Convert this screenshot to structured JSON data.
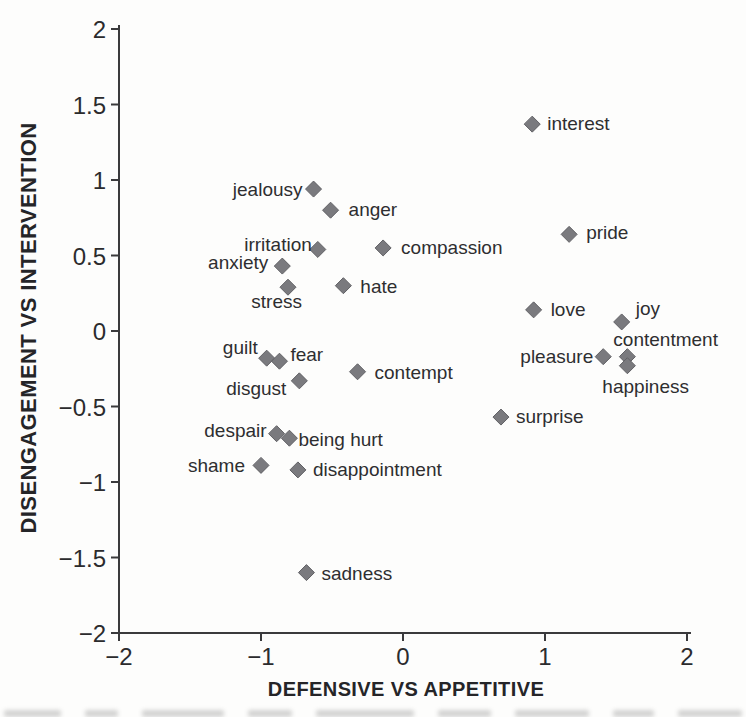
{
  "figure": {
    "background_color": "#fdfdfc",
    "marker_shape": "diamond",
    "marker_color": "#7a7a7e",
    "marker_edge_color": "#616165",
    "axis_color": "#3a3a3c",
    "text_color": "#2e2e30"
  },
  "chart_data": {
    "type": "scatter",
    "title": "",
    "xlabel": "DEFENSIVE VS APPETITIVE",
    "ylabel": "DISENGAGEMENT VS INTERVENTION",
    "xlim": [
      -2,
      2
    ],
    "ylim": [
      -2,
      2
    ],
    "xticks": [
      -2,
      -1,
      0,
      1,
      2
    ],
    "yticks": [
      2,
      1.5,
      1,
      0.5,
      0,
      -0.5,
      -1,
      -1.5,
      -2
    ],
    "grid": false,
    "legend": false,
    "points": [
      {
        "label": "interest",
        "x": 0.91,
        "y": 1.37,
        "anchor": "start",
        "lx": 15,
        "ly": 6
      },
      {
        "label": "jealousy",
        "x": -0.63,
        "y": 0.94,
        "anchor": "end",
        "lx": -11,
        "ly": 7
      },
      {
        "label": "anger",
        "x": -0.51,
        "y": 0.8,
        "anchor": "start",
        "lx": 18,
        "ly": 6
      },
      {
        "label": "irritation",
        "x": -0.6,
        "y": 0.54,
        "anchor": "end",
        "lx": -6,
        "ly": 2
      },
      {
        "label": "anxiety",
        "x": -0.85,
        "y": 0.43,
        "anchor": "end",
        "lx": -14,
        "ly": 3
      },
      {
        "label": "stress",
        "x": -0.81,
        "y": 0.29,
        "anchor": "end",
        "lx": 14,
        "ly": 21
      },
      {
        "label": "hate",
        "x": -0.42,
        "y": 0.3,
        "anchor": "start",
        "lx": 17,
        "ly": 7
      },
      {
        "label": "compassion",
        "x": -0.14,
        "y": 0.55,
        "anchor": "start",
        "lx": 18,
        "ly": 6
      },
      {
        "label": "pride",
        "x": 1.17,
        "y": 0.64,
        "anchor": "start",
        "lx": 17,
        "ly": 5
      },
      {
        "label": "love",
        "x": 0.92,
        "y": 0.14,
        "anchor": "start",
        "lx": 17,
        "ly": 6
      },
      {
        "label": "joy",
        "x": 1.54,
        "y": 0.06,
        "anchor": "start",
        "lx": 14,
        "ly": -7
      },
      {
        "label": "contentment",
        "x": 1.58,
        "y": -0.17,
        "anchor": "start",
        "lx": -14,
        "ly": -11
      },
      {
        "label": "pleasure",
        "x": 1.41,
        "y": -0.17,
        "anchor": "end",
        "lx": -10,
        "ly": 6
      },
      {
        "label": "happiness",
        "x": 1.58,
        "y": -0.23,
        "anchor": "start",
        "lx": -25,
        "ly": 27
      },
      {
        "label": "guilt",
        "x": -0.96,
        "y": -0.18,
        "anchor": "end",
        "lx": -9,
        "ly": -4
      },
      {
        "label": "fear",
        "x": -0.87,
        "y": -0.2,
        "anchor": "start",
        "lx": 11,
        "ly": 0
      },
      {
        "label": "disgust",
        "x": -0.73,
        "y": -0.33,
        "anchor": "end",
        "lx": -13,
        "ly": 14
      },
      {
        "label": "contempt",
        "x": -0.32,
        "y": -0.27,
        "anchor": "start",
        "lx": 17,
        "ly": 7
      },
      {
        "label": "surprise",
        "x": 0.69,
        "y": -0.57,
        "anchor": "start",
        "lx": 15,
        "ly": 6
      },
      {
        "label": "despair",
        "x": -0.89,
        "y": -0.68,
        "anchor": "end",
        "lx": -10,
        "ly": 3
      },
      {
        "label": "being hurt",
        "x": -0.8,
        "y": -0.71,
        "anchor": "start",
        "lx": 9,
        "ly": 8
      },
      {
        "label": "shame",
        "x": -1.0,
        "y": -0.89,
        "anchor": "end",
        "lx": -16,
        "ly": 7
      },
      {
        "label": "disappointment",
        "x": -0.74,
        "y": -0.92,
        "anchor": "start",
        "lx": 15,
        "ly": 6
      },
      {
        "label": "sadness",
        "x": -0.68,
        "y": -1.6,
        "anchor": "start",
        "lx": 15,
        "ly": 7
      }
    ]
  }
}
